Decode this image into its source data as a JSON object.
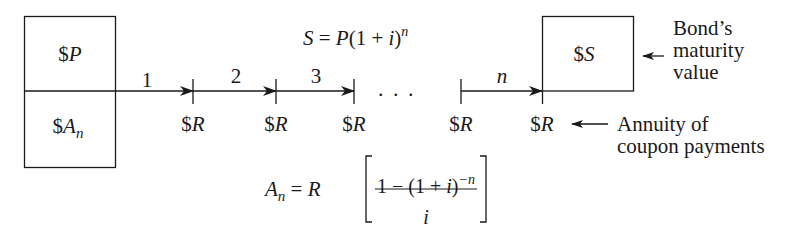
{
  "diagram": {
    "left_box": {
      "top_label_prefix": "$",
      "top_label_var": "P",
      "bottom_label_prefix": "$",
      "bottom_label_var": "A",
      "bottom_label_sub": "n"
    },
    "right_box": {
      "label_prefix": "$",
      "label_var": "S"
    },
    "formula_top": {
      "lhs": "S",
      "eq": " = ",
      "p": "P",
      "paren": "(1 + ",
      "i": "i",
      "close": ")",
      "exp": "n"
    },
    "formula_bottom": {
      "lhs": "A",
      "lhs_sub": "n",
      "eq": " = ",
      "r": "R",
      "numerator": "1 − (1 + ",
      "num_i": "i",
      "num_close": ")",
      "num_exp": "−n",
      "denominator": "i"
    },
    "periods": [
      "1",
      "2",
      "3",
      "n"
    ],
    "ellipsis": ".   .   .",
    "payments": [
      "$R",
      "$R",
      "$R",
      "$R",
      "$R"
    ],
    "payment_prefix": "$",
    "payment_var": "R",
    "annotations": {
      "maturity_line1": "Bond’s",
      "maturity_line2": "maturity",
      "maturity_line3": "value",
      "annuity_line1": "Annuity of",
      "annuity_line2": "coupon payments"
    },
    "colors": {
      "ink": "#1a1a1a",
      "background": "#ffffff"
    }
  }
}
